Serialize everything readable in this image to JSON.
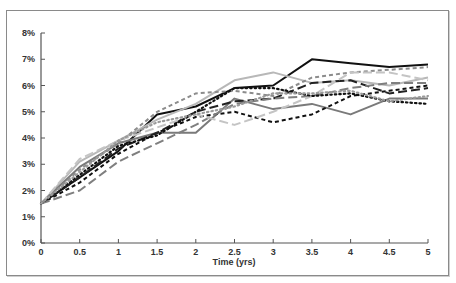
{
  "chart_data": {
    "type": "line",
    "title": "",
    "xlabel": "Time (yrs)",
    "ylabel": "",
    "x": [
      0,
      0.5,
      1,
      1.5,
      2,
      2.5,
      3,
      3.5,
      4,
      4.5,
      5
    ],
    "x_ticks": [
      "0",
      "0.5",
      "1",
      "1.5",
      "2",
      "2.5",
      "3",
      "3.5",
      "4",
      "4.5",
      "5"
    ],
    "y_ticks": [
      "0%",
      "1%",
      "2%",
      "3%",
      "4%",
      "5%",
      "6%",
      "7%",
      "8%"
    ],
    "xlim": [
      0,
      5
    ],
    "ylim": [
      0,
      8
    ],
    "grid": false,
    "legend": "none",
    "series": [
      {
        "name": "Path 1",
        "color": "#111111",
        "style": "solid",
        "values": [
          1.5,
          2.5,
          3.5,
          4.9,
          5.2,
          5.9,
          6.0,
          7.0,
          6.85,
          6.7,
          6.8
        ]
      },
      {
        "name": "Path 2",
        "color": "#b8b8b8",
        "style": "solid",
        "values": [
          1.5,
          3.1,
          3.9,
          4.7,
          5.3,
          6.2,
          6.5,
          6.1,
          6.2,
          6.0,
          6.3
        ]
      },
      {
        "name": "Path 3",
        "color": "#7a7a7a",
        "style": "solid",
        "values": [
          1.5,
          2.9,
          3.8,
          4.2,
          4.2,
          5.5,
          5.1,
          5.3,
          4.9,
          5.5,
          5.5
        ]
      },
      {
        "name": "Path 4",
        "color": "#8c8c8c",
        "style": "short-dash",
        "values": [
          1.5,
          2.8,
          3.8,
          5.0,
          5.7,
          5.8,
          5.6,
          6.3,
          6.5,
          6.6,
          6.7
        ]
      },
      {
        "name": "Path 5",
        "color": "#111111",
        "style": "short-dash",
        "values": [
          1.5,
          2.3,
          3.4,
          4.2,
          4.8,
          5.0,
          4.6,
          4.9,
          5.6,
          5.8,
          6.0
        ]
      },
      {
        "name": "Path 6",
        "color": "#222222",
        "style": "long-dash",
        "values": [
          1.5,
          2.5,
          3.6,
          4.2,
          5.0,
          5.4,
          5.5,
          6.1,
          6.2,
          5.7,
          5.9
        ]
      },
      {
        "name": "Path 7",
        "color": "#7f7f7f",
        "style": "long-dash",
        "values": [
          1.5,
          2.0,
          3.1,
          3.8,
          4.5,
          5.3,
          5.5,
          5.6,
          5.9,
          6.1,
          6.1
        ]
      },
      {
        "name": "Path 8",
        "color": "#c4c4c4",
        "style": "long-dash",
        "values": [
          1.5,
          3.2,
          3.9,
          4.4,
          4.9,
          4.5,
          5.0,
          5.6,
          6.5,
          6.5,
          6.2
        ]
      },
      {
        "name": "Path 9",
        "color": "#111111",
        "style": "dotted",
        "values": [
          1.5,
          2.6,
          3.7,
          4.1,
          5.0,
          5.9,
          5.9,
          5.6,
          5.7,
          5.4,
          5.3
        ]
      },
      {
        "name": "Path 10",
        "color": "#9a9a9a",
        "style": "dotted",
        "values": [
          1.5,
          2.7,
          3.9,
          4.6,
          4.9,
          5.2,
          5.7,
          5.7,
          5.8,
          5.4,
          5.6
        ]
      }
    ]
  }
}
